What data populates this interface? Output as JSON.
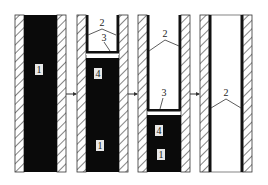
{
  "diagram": {
    "type": "sequential-process",
    "stages": [
      {
        "id": "stage-1",
        "labels": [
          "1"
        ]
      },
      {
        "id": "stage-2",
        "labels": [
          "2",
          "3",
          "4",
          "1"
        ]
      },
      {
        "id": "stage-3",
        "labels": [
          "2",
          "3",
          "4",
          "1"
        ]
      },
      {
        "id": "stage-4",
        "labels": [
          "2"
        ]
      }
    ],
    "labels": {
      "s1_fill": "1",
      "s2_top": "2",
      "s2_interface": "3",
      "s2_mid": "4",
      "s2_fill": "1",
      "s3_top": "2",
      "s3_interface": "3",
      "s3_mid": "4",
      "s3_fill": "1",
      "s4_wall": "2"
    },
    "colors": {
      "fill": "#0a0a0a",
      "hatch": "#333333",
      "wall": "#ffffff",
      "outline": "#333333"
    }
  }
}
